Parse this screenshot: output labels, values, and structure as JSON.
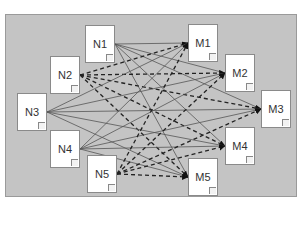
{
  "diagram": {
    "sources": [
      {
        "id": "N1",
        "label": "N1",
        "x": 85,
        "y": 25,
        "edge_style": "solid"
      },
      {
        "id": "N2",
        "label": "N2",
        "x": 50,
        "y": 56,
        "edge_style": "dashed"
      },
      {
        "id": "N3",
        "label": "N3",
        "x": 17,
        "y": 93,
        "edge_style": "solid"
      },
      {
        "id": "N4",
        "label": "N4",
        "x": 50,
        "y": 130,
        "edge_style": "solid"
      },
      {
        "id": "N5",
        "label": "N5",
        "x": 87,
        "y": 155,
        "edge_style": "dashed"
      }
    ],
    "targets": [
      {
        "id": "M1",
        "label": "M1",
        "x": 188,
        "y": 24
      },
      {
        "id": "M2",
        "label": "M2",
        "x": 225,
        "y": 54
      },
      {
        "id": "M3",
        "label": "M3",
        "x": 261,
        "y": 90
      },
      {
        "id": "M4",
        "label": "M4",
        "x": 225,
        "y": 127
      },
      {
        "id": "M5",
        "label": "M5",
        "x": 188,
        "y": 158
      }
    ],
    "edges_note": "each source connects to every target; N2 and N5 use dashed arrows",
    "colors": {
      "panel": "#c4c4c4",
      "node": "#ffffff",
      "edge": "#555555",
      "dashed_edge": "#222222"
    }
  }
}
